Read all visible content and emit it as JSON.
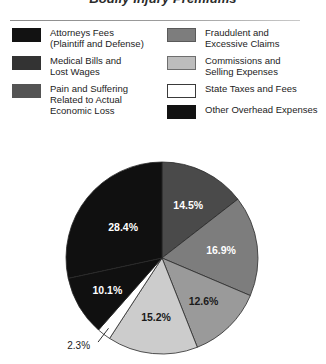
{
  "title": "Bodily Injury Premiums",
  "legend": {
    "left_column": [
      {
        "label": "Attorneys Fees\n(Plaintiff and Defense)",
        "color": "#121212",
        "border": "#121212",
        "swatch_name": "legend-swatch-attorneys-fees"
      },
      {
        "label": "Medical Bills and\nLost Wages",
        "color": "#333333",
        "border": "#333333",
        "swatch_name": "legend-swatch-medical-bills"
      },
      {
        "label": "Pain and Suffering\nRelated to Actual\nEconomic Loss",
        "color": "#545454",
        "border": "#545454",
        "swatch_name": "legend-swatch-pain-and-suffering"
      }
    ],
    "right_column": [
      {
        "label": "Fraudulent and\nExcessive Claims",
        "color": "#7d7d7d",
        "border": "#5a5a5a",
        "swatch_name": "legend-swatch-fraudulent-claims"
      },
      {
        "label": "Commissions and\nSelling Expenses",
        "color": "#bdbdbd",
        "border": "#6e6e6e",
        "swatch_name": "legend-swatch-commissions"
      },
      {
        "label": "State Taxes and Fees",
        "color": "#ffffff",
        "border": "#3a3a3a",
        "swatch_name": "legend-swatch-state-taxes"
      },
      {
        "label": "Other Overhead Expenses",
        "color": "#121212",
        "border": "#121212",
        "swatch_name": "legend-swatch-other-overhead"
      }
    ]
  },
  "chart_data": {
    "type": "pie",
    "title": "Bodily Injury Premiums",
    "xlabel": "",
    "ylabel": "",
    "units": "percent",
    "start_angle_deg": 0,
    "direction": "clockwise",
    "legend_position": "top",
    "grid": false,
    "categories": [
      "Fraudulent and Excessive Claims",
      "Commissions and Selling Expenses",
      "Pain and Suffering Related to Actual Economic Loss",
      "Medical Bills and Lost Wages",
      "State Taxes and Fees",
      "Attorneys Fees (Plaintiff and Defense)",
      "Other Overhead Expenses"
    ],
    "values": [
      14.5,
      16.9,
      12.6,
      15.2,
      2.3,
      10.1,
      28.4
    ],
    "slices": [
      {
        "label": "14.5%",
        "value": 14.5,
        "color": "#4a4a4a",
        "label_fill": "light",
        "name": "pie-slice-14-5"
      },
      {
        "label": "16.9%",
        "value": 16.9,
        "color": "#7d7d7d",
        "label_fill": "light",
        "name": "pie-slice-16-9"
      },
      {
        "label": "12.6%",
        "value": 12.6,
        "color": "#9a9a9a",
        "label_fill": "dark",
        "name": "pie-slice-12-6"
      },
      {
        "label": "15.2%",
        "value": 15.2,
        "color": "#cccccc",
        "label_fill": "dark",
        "name": "pie-slice-15-2"
      },
      {
        "label": "2.3%",
        "value": 2.3,
        "color": "#ffffff",
        "label_fill": "dark",
        "name": "pie-slice-2-3",
        "callout": true
      },
      {
        "label": "10.1%",
        "value": 10.1,
        "color": "#101010",
        "label_fill": "light",
        "name": "pie-slice-10-1"
      },
      {
        "label": "28.4%",
        "value": 28.4,
        "color": "#101010",
        "label_fill": "light",
        "name": "pie-slice-28-4"
      }
    ]
  }
}
